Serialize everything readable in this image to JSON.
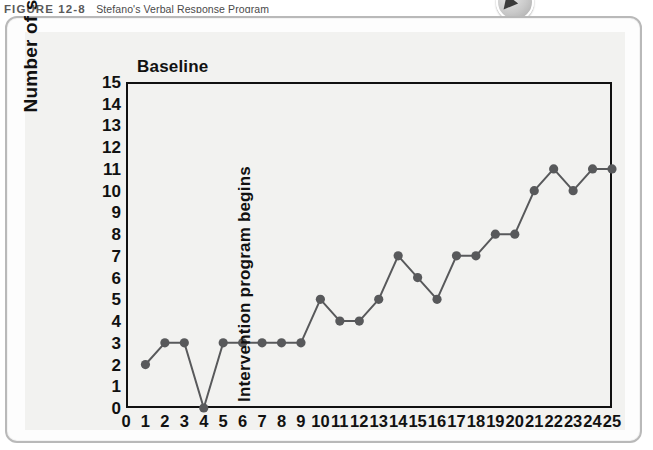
{
  "figure": {
    "label": "FIGURE 12-8",
    "title": "Stefano's Verbal Response Program"
  },
  "badge": {
    "icon": "play-triangle-icon"
  },
  "annotations": {
    "baseline": "Baseline",
    "intervention": "Intervention program begins"
  },
  "chart_data": {
    "type": "line",
    "title": "Stefano's Verbal Response Program",
    "xlabel": "",
    "ylabel": "Number of single words",
    "xlim": [
      0,
      25
    ],
    "ylim": [
      0,
      15
    ],
    "grid": false,
    "legend": false,
    "marker": "circle",
    "series_color": "#58595b",
    "x_ticks": [
      0,
      1,
      2,
      3,
      4,
      5,
      6,
      7,
      8,
      9,
      10,
      11,
      12,
      13,
      14,
      15,
      16,
      17,
      18,
      19,
      20,
      21,
      22,
      23,
      24,
      25
    ],
    "y_ticks": [
      0,
      1,
      2,
      3,
      4,
      5,
      6,
      7,
      8,
      9,
      10,
      11,
      12,
      13,
      14,
      15
    ],
    "x": [
      1,
      2,
      3,
      4,
      5,
      6,
      7,
      8,
      9,
      10,
      11,
      12,
      13,
      14,
      15,
      16,
      17,
      18,
      19,
      20,
      21,
      22,
      23,
      24,
      25
    ],
    "values": [
      2,
      3,
      3,
      0,
      3,
      3,
      3,
      3,
      3,
      5,
      4,
      4,
      5,
      7,
      6,
      5,
      7,
      7,
      8,
      8,
      10,
      11,
      10,
      11,
      11
    ],
    "phase_divider_x": 9.5,
    "phases": [
      {
        "name": "Baseline",
        "from": 1,
        "to": 9
      },
      {
        "name": "Intervention program begins",
        "from": 10,
        "to": 25
      }
    ]
  }
}
